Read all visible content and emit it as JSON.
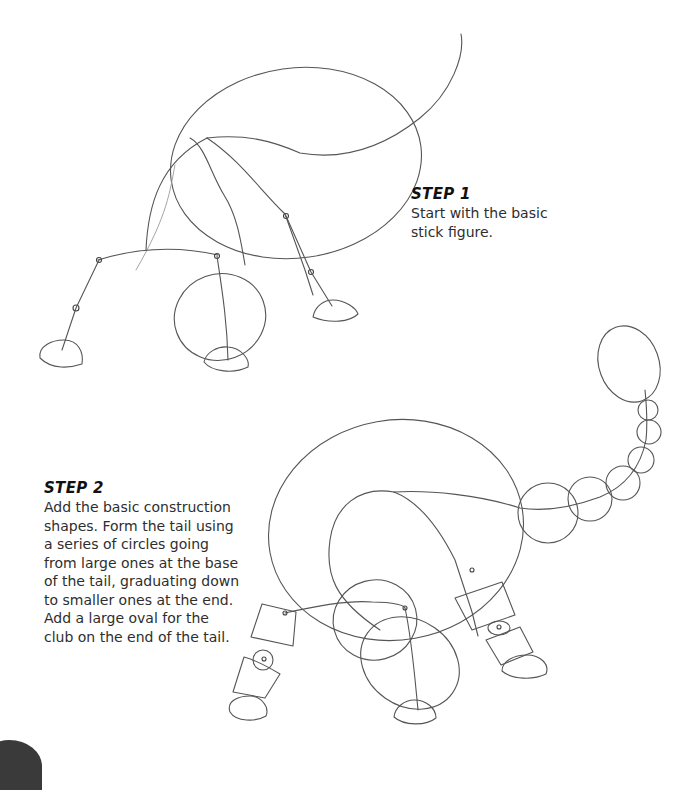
{
  "steps": [
    {
      "title": "STEP 1",
      "text": "Start with the basic\nstick figure."
    },
    {
      "title": "STEP 2",
      "text": "Add the basic construction\nshapes. Form the tail using\na series of circles going\nfrom large ones at the base\nof the tail, graduating down\nto smaller ones at the end.\nAdd a large oval for the\nclub on the end of the tail."
    }
  ],
  "illustrations": [
    {
      "label": "step-1-stick-figure",
      "subject": "dinosaur stick figure with body oval, head oval, curved tail and four legs with feet"
    },
    {
      "label": "step-2-construction-shapes",
      "subject": "dinosaur with body oval, tail of graduated circles ending in club oval, cylinder leg segments and oval feet"
    }
  ],
  "colors": {
    "background": "#ffffff",
    "pencil": "#555555",
    "text": "#2e2e2e",
    "heading": "#111111"
  }
}
